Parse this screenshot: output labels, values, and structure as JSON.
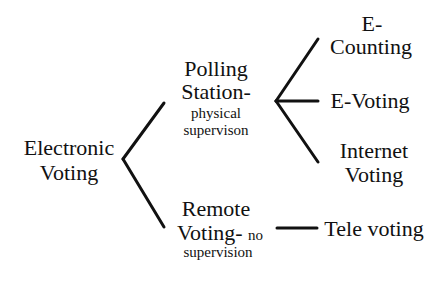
{
  "diagram": {
    "type": "tree",
    "root": {
      "label_lines": [
        "Electronic",
        "Voting"
      ]
    },
    "branches": [
      {
        "id": "polling-station",
        "label_lines": [
          "Polling",
          "Station-"
        ],
        "sublabel_lines": [
          "physical",
          "supervison"
        ],
        "children": [
          {
            "id": "e-counting",
            "label_lines": [
              "E-",
              "Counting"
            ]
          },
          {
            "id": "e-voting",
            "label_lines": [
              "E-Voting"
            ]
          },
          {
            "id": "internet-voting",
            "label_lines": [
              "Internet",
              "Voting"
            ]
          }
        ]
      },
      {
        "id": "remote-voting",
        "label_lines": [
          "Remote",
          "Voting-"
        ],
        "inline_note": "no",
        "sublabel_lines": [
          "supervision"
        ],
        "children": [
          {
            "id": "tele-voting",
            "label_lines": [
              "Tele voting"
            ]
          }
        ]
      }
    ],
    "colors": {
      "line": "#111111",
      "text": "#111111",
      "background": "#ffffff"
    }
  }
}
